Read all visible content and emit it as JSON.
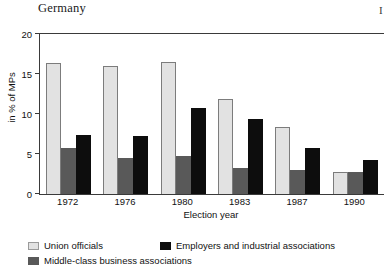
{
  "header": {
    "title": "Germany",
    "corner_mark": "I"
  },
  "chart_data": {
    "type": "bar",
    "title": "Germany",
    "xlabel": "Election year",
    "ylabel": "in % of MPs",
    "categories": [
      "1972",
      "1976",
      "1980",
      "1983",
      "1987",
      "1990"
    ],
    "ylim": [
      0,
      20
    ],
    "yticks": [
      0,
      5,
      10,
      15,
      20
    ],
    "grid": false,
    "legend_position": "bottom",
    "series": [
      {
        "name": "Union officials",
        "color": "#e2e2e2",
        "values": [
          16.4,
          16.0,
          16.5,
          11.9,
          8.4,
          2.8
        ]
      },
      {
        "name": "Middle-class business associations",
        "color": "#595959",
        "values": [
          5.8,
          4.5,
          4.8,
          3.2,
          3.0,
          2.8
        ]
      },
      {
        "name": "Employers and industrial associations",
        "color": "#0d0d0d",
        "values": [
          7.4,
          7.3,
          10.8,
          9.4,
          5.8,
          4.2
        ]
      }
    ]
  },
  "legend": {
    "row1": [
      {
        "label": "Union officials",
        "series": 0
      },
      {
        "label": "Employers and industrial associations",
        "series": 2
      }
    ],
    "row2": [
      {
        "label": "Middle-class business associations",
        "series": 1
      }
    ]
  }
}
